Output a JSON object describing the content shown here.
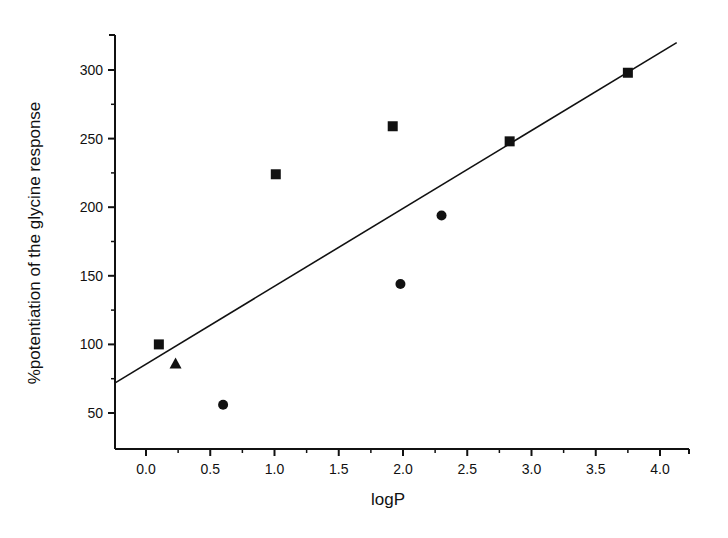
{
  "chart_data": {
    "type": "scatter",
    "title": "",
    "xlabel": "logP",
    "ylabel": "%potentiation of the glycine response",
    "xlim": [
      -0.25,
      4.25
    ],
    "ylim": [
      25,
      325
    ],
    "x_ticks": [
      0.0,
      0.5,
      1.0,
      1.5,
      2.0,
      2.5,
      3.0,
      3.5,
      4.0
    ],
    "x_tick_labels": [
      "0.0",
      "0.5",
      "1.0",
      "1.5",
      "2.0",
      "2.5",
      "3.0",
      "3.5",
      "4.0"
    ],
    "y_ticks": [
      50,
      100,
      150,
      200,
      250,
      300
    ],
    "y_tick_labels": [
      "50",
      "100",
      "150",
      "200",
      "250",
      "300"
    ],
    "grid": false,
    "legend": null,
    "series": [
      {
        "name": "squares",
        "marker": "square",
        "points": [
          {
            "x": 0.1,
            "y": 100
          },
          {
            "x": 1.01,
            "y": 224
          },
          {
            "x": 1.92,
            "y": 259
          },
          {
            "x": 2.83,
            "y": 248
          },
          {
            "x": 3.75,
            "y": 298
          }
        ]
      },
      {
        "name": "triangles",
        "marker": "triangle",
        "points": [
          {
            "x": 0.23,
            "y": 86
          }
        ]
      },
      {
        "name": "circles",
        "marker": "circle",
        "points": [
          {
            "x": 0.6,
            "y": 56
          },
          {
            "x": 1.98,
            "y": 144
          },
          {
            "x": 2.3,
            "y": 194
          }
        ]
      }
    ],
    "fit_line": {
      "type": "linear",
      "x_start": -0.24,
      "y_start": 72,
      "x_end": 4.13,
      "y_end": 320
    }
  },
  "colors": {
    "ink": "#111111",
    "background": "#ffffff"
  }
}
